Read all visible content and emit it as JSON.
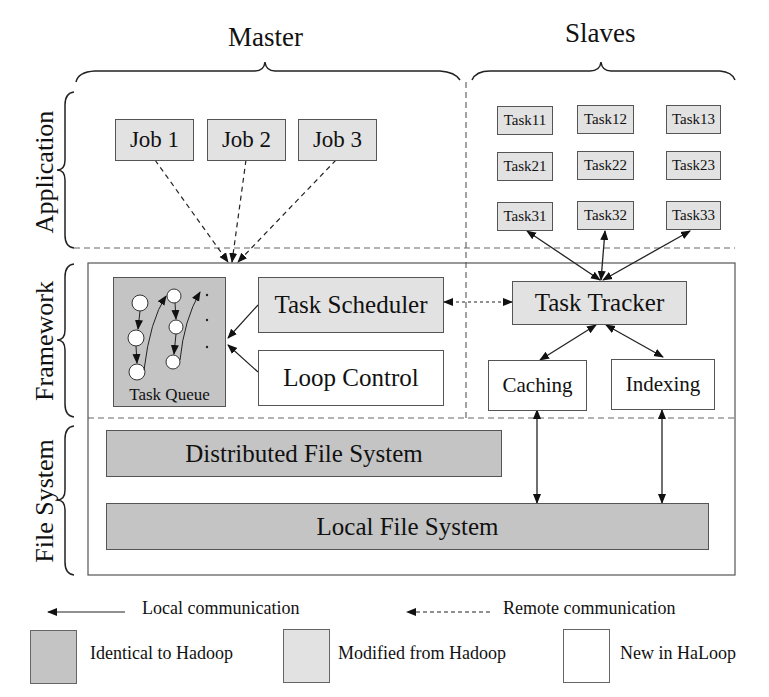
{
  "headers": {
    "master": "Master",
    "slaves": "Slaves"
  },
  "layers": {
    "application": "Application",
    "framework": "Framework",
    "file_system": "File System"
  },
  "application": {
    "jobs": [
      "Job 1",
      "Job 2",
      "Job 3"
    ],
    "tasks": [
      [
        "Task11",
        "Task12",
        "Task13"
      ],
      [
        "Task21",
        "Task22",
        "Task23"
      ],
      [
        "Task31",
        "Task32",
        "Task33"
      ]
    ]
  },
  "framework": {
    "task_queue": "Task Queue",
    "task_scheduler": "Task Scheduler",
    "loop_control": "Loop Control",
    "task_tracker": "Task Tracker",
    "caching": "Caching",
    "indexing": "Indexing"
  },
  "file_system": {
    "distributed": "Distributed File System",
    "local": "Local File System"
  },
  "legend": {
    "local_comm": "Local communication",
    "remote_comm": "Remote communication",
    "identical": "Identical to Hadoop",
    "modified": "Modified from Hadoop",
    "new": "New in HaLoop"
  },
  "colors": {
    "identical": "#c4c4c4",
    "modified": "#e2e2e2",
    "new": "#ffffff"
  }
}
